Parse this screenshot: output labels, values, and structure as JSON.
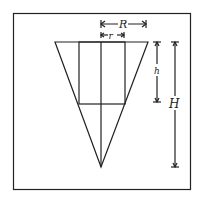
{
  "diagram": {
    "labels": {
      "big_radius": "R",
      "small_radius": "r",
      "cylinder_height": "h",
      "cone_height": "H"
    },
    "colors": {
      "stroke": "#222222",
      "background": "#ffffff"
    }
  }
}
